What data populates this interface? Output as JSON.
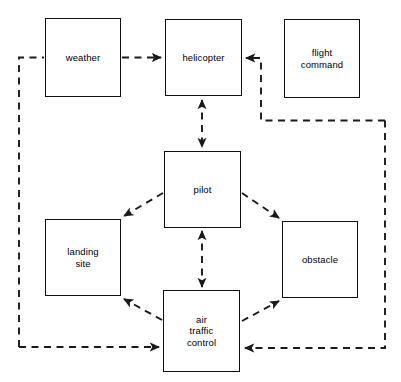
{
  "diagram": {
    "type": "block-diagram",
    "canvas": {
      "width": 401,
      "height": 382
    },
    "style": {
      "node_border_color": "#111111",
      "node_fill_color": "#ffffff",
      "edge_color": "#1a1a1a",
      "background_color": "#ffffff",
      "edge_style": "dashed"
    },
    "nodes": [
      {
        "id": "weather",
        "label": "weather",
        "x": 45,
        "y": 18,
        "w": 76,
        "h": 79
      },
      {
        "id": "helicopter",
        "label": "helicopter",
        "x": 165,
        "y": 19,
        "w": 77,
        "h": 77
      },
      {
        "id": "flight_command",
        "label": "flight\ncommand",
        "x": 284,
        "y": 19,
        "w": 76,
        "h": 79
      },
      {
        "id": "pilot",
        "label": "pilot",
        "x": 164,
        "y": 151,
        "w": 77,
        "h": 77
      },
      {
        "id": "landing_site",
        "label": "landing\nsite",
        "x": 45,
        "y": 219,
        "w": 76,
        "h": 77
      },
      {
        "id": "obstacle",
        "label": "obstacle",
        "x": 282,
        "y": 221,
        "w": 76,
        "h": 77
      },
      {
        "id": "air_traffic_control",
        "label": "air\ntraffic\ncontrol",
        "x": 163,
        "y": 290,
        "w": 77,
        "h": 82
      }
    ],
    "edges": [
      {
        "id": "weather-to-helicopter",
        "from": "weather",
        "to": "helicopter",
        "arrows": "one-way"
      },
      {
        "id": "atc-to-weather",
        "from": "air_traffic_control",
        "to": "weather",
        "arrows": "one-way-routed-left"
      },
      {
        "id": "atc-to-helicopter",
        "from": "air_traffic_control",
        "to": "helicopter",
        "arrows": "one-way-routed-right"
      },
      {
        "id": "helicopter-pilot",
        "from": "helicopter",
        "to": "pilot",
        "arrows": "two-way"
      },
      {
        "id": "pilot-to-landing-site",
        "from": "pilot",
        "to": "landing_site",
        "arrows": "one-way"
      },
      {
        "id": "pilot-to-obstacle",
        "from": "pilot",
        "to": "obstacle",
        "arrows": "one-way"
      },
      {
        "id": "pilot-atc",
        "from": "pilot",
        "to": "air_traffic_control",
        "arrows": "two-way"
      },
      {
        "id": "atc-to-landing-site",
        "from": "air_traffic_control",
        "to": "landing_site",
        "arrows": "one-way"
      },
      {
        "id": "atc-to-obstacle",
        "from": "air_traffic_control",
        "to": "obstacle",
        "arrows": "one-way"
      },
      {
        "id": "right-loop-to-atc",
        "from": "flight_command",
        "to": "air_traffic_control",
        "arrows": "one-way-routed-right"
      }
    ]
  }
}
